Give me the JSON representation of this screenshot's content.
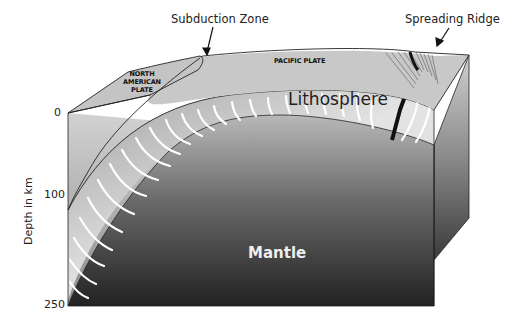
{
  "diagram": {
    "type": "tectonic-block-diagram",
    "callouts": {
      "subduction_zone": "Subduction Zone",
      "spreading_ridge": "Spreading Ridge"
    },
    "plates": {
      "north_american": [
        "NORTH",
        "AMERICAN",
        "PLATE"
      ],
      "pacific": "PACIFIC PLATE"
    },
    "layers": {
      "lithosphere": "Lithosphere",
      "mantle": "Mantle"
    },
    "axis": {
      "title": "Depth in km",
      "ticks": [
        "0",
        "100",
        "250"
      ]
    },
    "colors": {
      "surface": "#c8c8c8",
      "lithosphere_light": "#ececec",
      "lithosphere_dark": "#8e8e8e",
      "mantle_top": "#b4b4b4",
      "mantle_bottom": "#222222",
      "ridge": "#111111",
      "stress_lines": "#ffffff"
    }
  }
}
